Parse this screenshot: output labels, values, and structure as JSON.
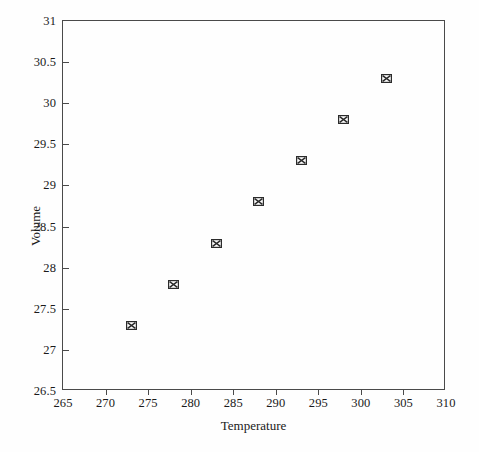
{
  "chart_data": {
    "type": "scatter",
    "title": "",
    "xlabel": "Temperature",
    "ylabel": "Volume",
    "xlim": [
      265,
      310
    ],
    "ylim": [
      26.5,
      31
    ],
    "xticks": [
      265,
      270,
      275,
      280,
      285,
      290,
      295,
      300,
      305,
      310
    ],
    "yticks": [
      26.5,
      27,
      27.5,
      28,
      28.5,
      29,
      29.5,
      30,
      30.5,
      31
    ],
    "xtick_labels": [
      "265",
      "270",
      "275",
      "280",
      "285",
      "290",
      "295",
      "300",
      "305",
      "310"
    ],
    "ytick_labels": [
      "26.5",
      "27",
      "27.5",
      "28",
      "28.5",
      "29",
      "29.5",
      "30",
      "30.5",
      "31"
    ],
    "grid": false,
    "legend": null,
    "marker_style": "boxed-x",
    "marker_color": "#2b2b2b",
    "series": [
      {
        "name": "Volume vs Temperature",
        "x": [
          273,
          278,
          283,
          288,
          293,
          298,
          303
        ],
        "y": [
          27.3,
          27.8,
          28.3,
          28.8,
          29.3,
          29.8,
          30.3
        ]
      }
    ],
    "points": [
      {
        "x": 273,
        "y": 27.3
      },
      {
        "x": 278,
        "y": 27.8
      },
      {
        "x": 283,
        "y": 28.3
      },
      {
        "x": 288,
        "y": 28.8
      },
      {
        "x": 293,
        "y": 29.3
      },
      {
        "x": 298,
        "y": 29.8
      },
      {
        "x": 303,
        "y": 30.3
      }
    ]
  },
  "figure": {
    "background_color": "#fefefe",
    "axis_color": "#4a4a4a",
    "text_color": "#1a1a1a"
  }
}
